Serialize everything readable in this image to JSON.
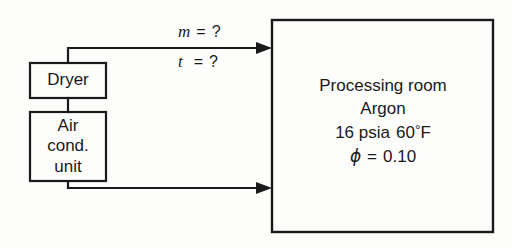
{
  "diagram": {
    "background_color": "#fdfdfc",
    "line_color": "#1a1a1a",
    "text_color": "#1a1a1a",
    "boxes": {
      "dryer": {
        "label": "Dryer"
      },
      "air_conditioning_unit": {
        "line1": "Air",
        "line2": "cond.",
        "line3": "unit"
      },
      "processing_room": {
        "line1": "Processing room",
        "line2": "Argon",
        "pressure": "16 psia",
        "temperature_value": "60",
        "degree_symbol": "°",
        "temperature_unit": "F",
        "phi_symbol": "ϕ",
        "equals": "=",
        "relative_humidity": "0.10"
      }
    },
    "stream_labels": {
      "mass_flow": {
        "symbol": "m",
        "equals": "=",
        "value": "?"
      },
      "temperature": {
        "symbol": "t",
        "equals": "=",
        "value": "?"
      }
    }
  }
}
